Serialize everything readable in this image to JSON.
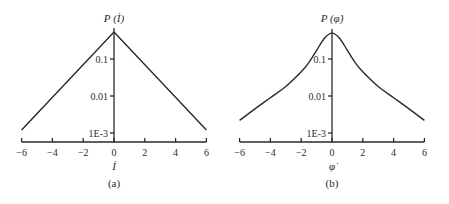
{
  "chart_data": [
    {
      "type": "line",
      "panel_caption": "(a)",
      "title": "",
      "xlabel": "İ",
      "ylabel": "P (İ)",
      "yscale": "log",
      "xlim": [
        -6,
        6
      ],
      "ylim": [
        0.0007,
        0.5
      ],
      "xticks": [
        -6,
        -4,
        -2,
        0,
        2,
        4,
        6
      ],
      "xtick_labels": [
        "−6",
        "−4",
        "−2",
        "0",
        "2",
        "4",
        "6"
      ],
      "yticks": [
        0.1,
        0.01,
        0.001
      ],
      "ytick_labels": [
        "0.1",
        "0.01",
        "1E-3"
      ],
      "grid": false,
      "series": [
        {
          "name": "P(İ)",
          "x": [
            -6,
            -4,
            -2,
            0,
            2,
            4,
            6
          ],
          "values": [
            0.0012,
            0.0048,
            0.019,
            0.54,
            0.019,
            0.0048,
            0.0012
          ]
        }
      ]
    },
    {
      "type": "line",
      "panel_caption": "(b)",
      "title": "",
      "xlabel": "φ̇",
      "ylabel": "P (φ̇)",
      "yscale": "log",
      "xlim": [
        -6,
        6
      ],
      "ylim": [
        0.0007,
        0.5
      ],
      "xticks": [
        -6,
        -4,
        -2,
        0,
        2,
        4,
        6
      ],
      "xtick_labels": [
        "−6",
        "−4",
        "−2",
        "0",
        "2",
        "4",
        "6"
      ],
      "yticks": [
        0.1,
        0.01,
        0.001
      ],
      "ytick_labels": [
        "0.1",
        "0.01",
        "1E-3"
      ],
      "grid": false,
      "series": [
        {
          "name": "P(φ̇)",
          "x": [
            -6,
            -5,
            -4,
            -3,
            -2,
            -1.5,
            -1,
            -0.5,
            0,
            0.5,
            1,
            1.5,
            2,
            3,
            4,
            5,
            6
          ],
          "values": [
            0.0022,
            0.0045,
            0.009,
            0.018,
            0.045,
            0.08,
            0.17,
            0.36,
            0.5,
            0.36,
            0.17,
            0.08,
            0.045,
            0.018,
            0.009,
            0.0045,
            0.0022
          ]
        }
      ]
    }
  ]
}
